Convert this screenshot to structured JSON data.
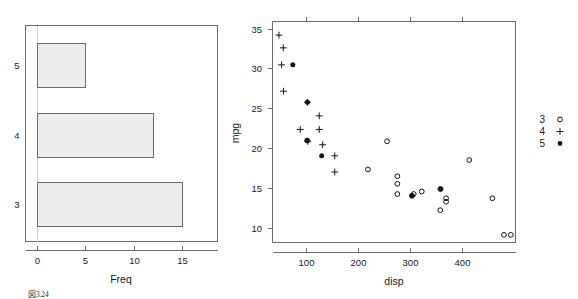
{
  "figure": {
    "background": "#ffffff",
    "foreground": "#1a1a1a",
    "axis_color": "#6b6b6b",
    "bar_fill": "#ededed",
    "point_color": "#141414",
    "caption": "図3.24"
  },
  "barchart": {
    "xlabel": "Freq",
    "ylabel": "",
    "x_ticks": [
      "0",
      "5",
      "10",
      "15"
    ],
    "y_ticks": [
      "5",
      "4",
      "3"
    ]
  },
  "scatter": {
    "xlabel": "disp",
    "ylabel": "mpg",
    "x_ticks": [
      "100",
      "200",
      "300",
      "400"
    ],
    "y_ticks": [
      "10",
      "15",
      "20",
      "25",
      "30",
      "35"
    ]
  },
  "legend": {
    "title": "",
    "entries": [
      {
        "label": "3",
        "symbol": "open-circle"
      },
      {
        "label": "4",
        "symbol": "plus"
      },
      {
        "label": "5",
        "symbol": "filled-circle"
      }
    ]
  },
  "chart_data": [
    {
      "type": "bar",
      "orientation": "horizontal",
      "title": "",
      "xlabel": "Freq",
      "ylabel": "",
      "categories": [
        "3",
        "4",
        "5"
      ],
      "values": [
        15,
        12,
        5
      ],
      "xlim": [
        0,
        15.8
      ],
      "x_ticks": [
        0,
        5,
        10,
        15
      ],
      "grid": false,
      "bar_fill": "#ededed",
      "bar_border": "#6b6b6b"
    },
    {
      "type": "scatter",
      "title": "",
      "xlabel": "disp",
      "ylabel": "mpg",
      "xlim": [
        60,
        480
      ],
      "ylim": [
        9.5,
        35.5
      ],
      "x_ticks": [
        100,
        200,
        300,
        400
      ],
      "y_ticks": [
        10,
        15,
        20,
        25,
        30,
        35
      ],
      "grid": false,
      "legend_position": "right",
      "series": [
        {
          "name": "3",
          "symbol": "open-circle",
          "points": [
            [
              258.0,
              21.4
            ],
            [
              225.0,
              18.1
            ],
            [
              275.8,
              17.3
            ],
            [
              275.8,
              16.4
            ],
            [
              275.8,
              15.2
            ],
            [
              301.0,
              15.0
            ],
            [
              318.0,
              15.5
            ],
            [
              304.0,
              15.2
            ],
            [
              350.0,
              15.8
            ],
            [
              360.0,
              14.3
            ],
            [
              360.0,
              14.7
            ],
            [
              400.0,
              19.2
            ],
            [
              440.0,
              14.7
            ],
            [
              460.0,
              10.4
            ],
            [
              472.0,
              10.4
            ],
            [
              350.0,
              13.3
            ],
            [
              120.1,
              21.5
            ]
          ]
        },
        {
          "name": "4",
          "symbol": "plus",
          "points": [
            [
              71.1,
              33.9
            ],
            [
              78.7,
              32.4
            ],
            [
              75.7,
              30.4
            ],
            [
              79.0,
              27.3
            ],
            [
              120.3,
              26.0
            ],
            [
              140.8,
              24.4
            ],
            [
              108.0,
              22.8
            ],
            [
              140.8,
              22.8
            ],
            [
              146.7,
              21.0
            ],
            [
              167.6,
              19.7
            ],
            [
              167.6,
              17.8
            ],
            [
              121.0,
              21.4
            ]
          ]
        },
        {
          "name": "5",
          "symbol": "filled-circle",
          "points": [
            [
              95.1,
              30.4
            ],
            [
              120.3,
              26.0
            ],
            [
              145.0,
              19.7
            ],
            [
              301.0,
              15.0
            ],
            [
              351.0,
              15.8
            ],
            [
              120.0,
              21.5
            ]
          ]
        }
      ]
    }
  ]
}
